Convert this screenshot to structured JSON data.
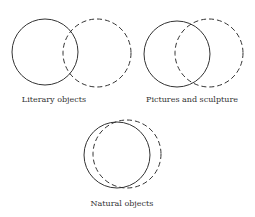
{
  "diagrams": [
    {
      "label": "Literary objects",
      "solid": {
        "cx": 45,
        "cy": 52,
        "r": 33
      },
      "dashed": {
        "cx": 97,
        "cy": 53,
        "r": 34
      },
      "label_x": 54,
      "label_y": 95
    },
    {
      "label": "Pictures and sculpture",
      "solid": {
        "cx": 177,
        "cy": 54,
        "r": 33
      },
      "dashed": {
        "cx": 209,
        "cy": 53,
        "r": 34
      },
      "label_x": 192,
      "label_y": 95
    },
    {
      "label": "Natural objects",
      "solid": {
        "cx": 117,
        "cy": 155,
        "r": 33
      },
      "dashed": {
        "cx": 127,
        "cy": 154,
        "r": 34
      },
      "label_x": 122,
      "label_y": 199
    }
  ],
  "colors": {
    "stroke": "#333333"
  }
}
